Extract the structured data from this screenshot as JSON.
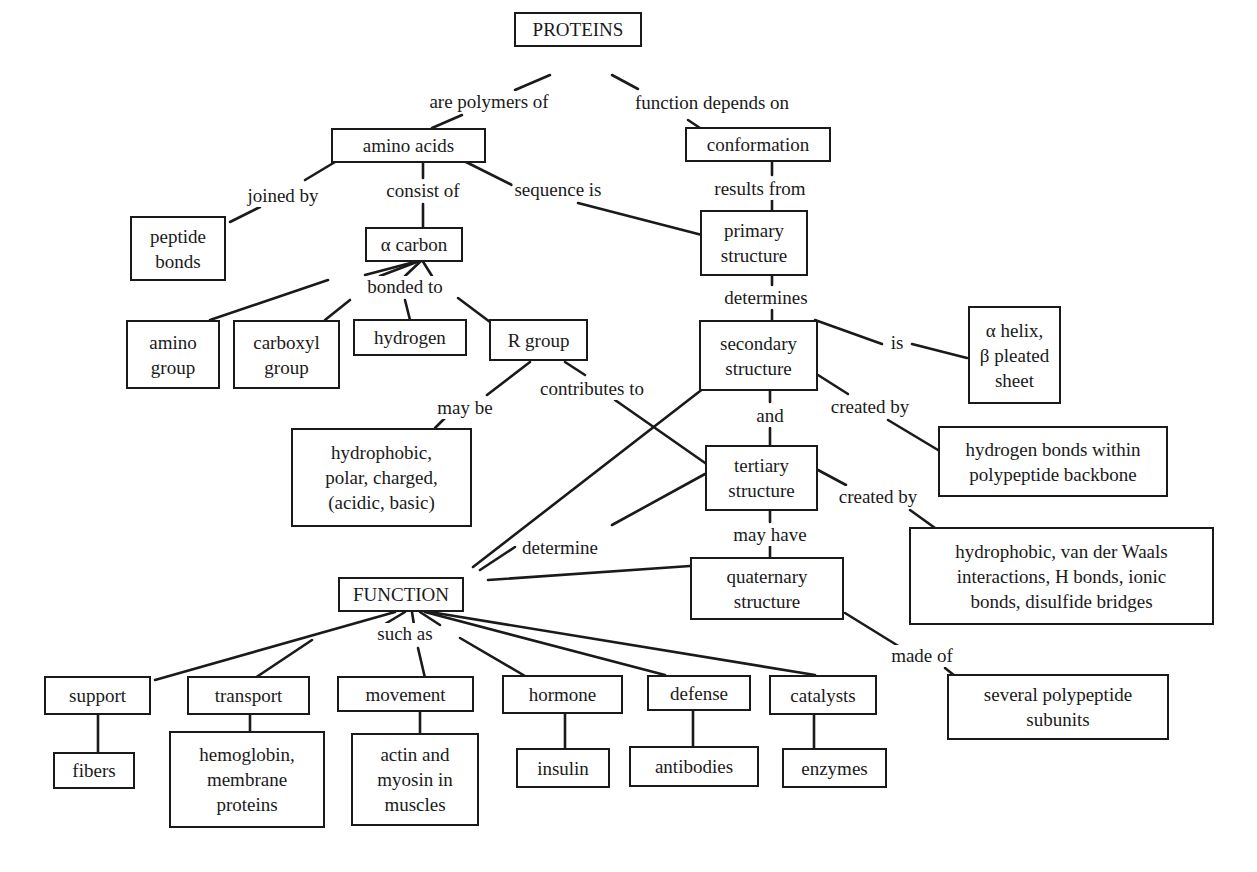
{
  "diagram": {
    "title": "PROTEINS",
    "type": "concept-map",
    "nodes": {
      "proteins": "PROTEINS",
      "amino_acids": "amino acids",
      "conformation": "conformation",
      "peptide_bonds": "peptide\nbonds",
      "alpha_carbon": "α carbon",
      "primary_structure": "primary\nstructure",
      "amino_group": "amino\ngroup",
      "carboxyl_group": "carboxyl\ngroup",
      "hydrogen": "hydrogen",
      "r_group": "R group",
      "secondary_structure": "secondary\nstructure",
      "helix_sheet": "α  helix,\nβ pleated\nsheet",
      "r_group_types": "hydrophobic,\npolar, charged,\n(acidic, basic)",
      "hydrogen_bonds_backbone": "hydrogen bonds within\npolypeptide backbone",
      "tertiary_structure": "tertiary\nstructure",
      "tertiary_bonds": "hydrophobic, van der Waals\ninteractions, H bonds, ionic\nbonds, disulfide bridges",
      "function": "FUNCTION",
      "quaternary_structure": "quaternary\nstructure",
      "polypeptide_subunits": "several polypeptide\nsubunits",
      "support": "support",
      "transport": "transport",
      "movement": "movement",
      "hormone": "hormone",
      "defense": "defense",
      "catalysts": "catalysts",
      "fibers": "fibers",
      "hemoglobin": "hemoglobin,\nmembrane\nproteins",
      "actin_myosin": "actin and\nmyosin in\nmuscles",
      "insulin": "insulin",
      "antibodies": "antibodies",
      "enzymes": "enzymes"
    },
    "link_labels": {
      "are_polymers_of": "are polymers of",
      "function_depends_on": "function depends on",
      "joined_by": "joined by",
      "consist_of": "consist of",
      "sequence_is": "sequence is",
      "results_from": "results from",
      "bonded_to": "bonded to",
      "determines": "determines",
      "is": "is",
      "may_be": "may be",
      "contributes_to": "contributes to",
      "and": "and",
      "created_by_secondary": "created by",
      "created_by_tertiary": "created by",
      "determine": "determine",
      "may_have": "may have",
      "such_as": "such as",
      "made_of": "made of"
    }
  }
}
